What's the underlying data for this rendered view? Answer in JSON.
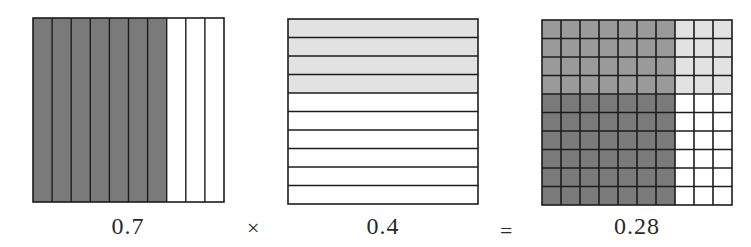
{
  "figure": {
    "colors": {
      "grid_line": "#1c1c1c",
      "dark_shade": "#7a7a7a",
      "overlap_shade": "#9a9a9a",
      "light_shade": "#e2e2e2",
      "unshaded": "#ffffff"
    },
    "panels": [
      {
        "id": "factor-a",
        "label": "0.7",
        "orientation": "vertical-strips",
        "divisions": 10,
        "shaded": 7,
        "shade": "dark"
      },
      {
        "id": "factor-b",
        "label": "0.4",
        "orientation": "horizontal-strips",
        "divisions": 10,
        "shaded": 4,
        "shade": "light"
      },
      {
        "id": "product",
        "label": "0.28",
        "orientation": "10x10-grid",
        "columns_shaded_dark": 7,
        "rows_shaded_light": 4,
        "overlap_cells": 28
      }
    ],
    "operators": {
      "times": "×",
      "equals": "="
    }
  }
}
